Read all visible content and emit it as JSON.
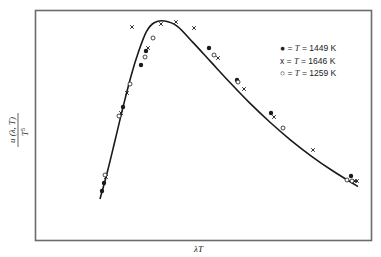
{
  "chart_data": {
    "type": "line",
    "title": "",
    "xlabel": "λT",
    "ylabel": "u(λ, T) / T^5",
    "ylabel_numerator": "u (λ, T)",
    "ylabel_denominator": "T",
    "ylabel_exponent": "5",
    "grid": false,
    "ticks": "none",
    "legend_position": "upper right",
    "curve": {
      "name": "fitted universal curve",
      "x_rel": [
        0.0,
        0.03,
        0.06,
        0.09,
        0.12,
        0.15,
        0.18,
        0.21,
        0.25,
        0.3,
        0.36,
        0.43,
        0.5,
        0.58,
        0.66,
        0.74,
        0.82,
        0.9,
        1.0
      ],
      "y_rel": [
        0.0,
        0.16,
        0.34,
        0.52,
        0.69,
        0.83,
        0.94,
        0.99,
        1.0,
        0.97,
        0.88,
        0.77,
        0.66,
        0.54,
        0.43,
        0.33,
        0.24,
        0.16,
        0.07
      ]
    },
    "series": [
      {
        "name": "T = 1449 K",
        "marker": "filled-circle",
        "label": "= T = 1449 K",
        "points_px": [
          [
            102,
            191
          ],
          [
            104,
            183
          ],
          [
            123,
            107
          ],
          [
            141,
            65
          ],
          [
            146,
            51
          ],
          [
            209,
            48
          ],
          [
            237,
            80
          ],
          [
            271,
            113
          ],
          [
            351,
            176
          ]
        ]
      },
      {
        "name": "T = 1646 K",
        "marker": "x",
        "label": "= T = 1646 K",
        "points_px": [
          [
            106,
            177
          ],
          [
            121,
            113
          ],
          [
            127,
            93
          ],
          [
            132,
            27
          ],
          [
            148,
            48
          ],
          [
            161,
            24
          ],
          [
            176,
            22
          ],
          [
            194,
            28
          ],
          [
            218,
            58
          ],
          [
            244,
            89
          ],
          [
            274,
            117
          ],
          [
            313,
            150
          ],
          [
            355,
            181
          ],
          [
            357,
            181
          ]
        ]
      },
      {
        "name": "T = 1259 K",
        "marker": "open-circle",
        "label": "= T = 1259 K",
        "points_px": [
          [
            105,
            175
          ],
          [
            119,
            116
          ],
          [
            130,
            84
          ],
          [
            145,
            57
          ],
          [
            153,
            38
          ],
          [
            214,
            55
          ],
          [
            238,
            82
          ],
          [
            283,
            128
          ],
          [
            347,
            180
          ],
          [
            352,
            181
          ]
        ]
      }
    ]
  },
  "legend": {
    "items": [
      {
        "symbol": "●",
        "prefix": " = ",
        "var": "T",
        "value": " = 1449 K"
      },
      {
        "symbol": "x",
        "prefix": " = ",
        "var": "T",
        "value": " = 1646 K"
      },
      {
        "symbol": "○",
        "prefix": " = ",
        "var": "T",
        "value": " = 1259 K"
      }
    ]
  },
  "axes": {
    "x_label": "λT",
    "y_numerator": "u (λ, T)",
    "y_denominator": "T",
    "y_exp": "5"
  },
  "colors": {
    "frame": "#6b6b6b",
    "curve": "#1a1a1a",
    "marker": "#1a1a1a",
    "background": "#ffffff"
  }
}
